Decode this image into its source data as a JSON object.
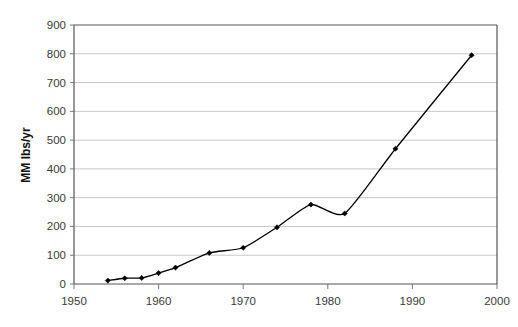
{
  "chart_data": {
    "type": "line",
    "title": "",
    "xlabel": "",
    "ylabel": "MM lbs/yr",
    "xlim": [
      1950,
      2000
    ],
    "ylim": [
      0,
      900
    ],
    "grid": true,
    "legend": "none",
    "x_ticks": [
      "1950",
      "1960",
      "1970",
      "1980",
      "1990",
      "2000"
    ],
    "x_tick_values": [
      1950,
      1960,
      1970,
      1980,
      1990,
      2000
    ],
    "y_ticks": [
      "0",
      "100",
      "200",
      "300",
      "400",
      "500",
      "600",
      "700",
      "800",
      "900"
    ],
    "y_tick_values": [
      0,
      100,
      200,
      300,
      400,
      500,
      600,
      700,
      800,
      900
    ],
    "marker": "diamond",
    "line_color": "#000000",
    "marker_color": "#000000",
    "grid_color": "#b8b8b8",
    "axis_color": "#555555",
    "series": [
      {
        "name": "production",
        "x": [
          1954,
          1956,
          1958,
          1960,
          1962,
          1966,
          1970,
          1974,
          1978,
          1982,
          1988,
          1997
        ],
        "values": [
          12,
          20,
          21,
          38,
          57,
          108,
          126,
          197,
          276,
          245,
          470,
          795
        ]
      }
    ],
    "points": [
      {
        "x": 1954,
        "y": 12
      },
      {
        "x": 1956,
        "y": 20
      },
      {
        "x": 1958,
        "y": 21
      },
      {
        "x": 1960,
        "y": 38
      },
      {
        "x": 1962,
        "y": 57
      },
      {
        "x": 1966,
        "y": 108
      },
      {
        "x": 1970,
        "y": 126
      },
      {
        "x": 1974,
        "y": 197
      },
      {
        "x": 1978,
        "y": 276
      },
      {
        "x": 1982,
        "y": 245
      },
      {
        "x": 1988,
        "y": 470
      },
      {
        "x": 1997,
        "y": 795
      }
    ]
  }
}
